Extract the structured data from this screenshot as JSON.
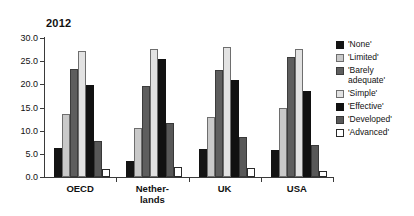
{
  "chart_data": {
    "type": "bar",
    "title": "2012",
    "xlabel": "",
    "ylabel": "",
    "ylim": [
      0,
      30
    ],
    "ytick_step": 5,
    "ytick_labels": [
      "0.0",
      "5.0",
      "10.0",
      "15.0",
      "20.0",
      "25.0",
      "30.0"
    ],
    "grid": false,
    "legend_position": "right",
    "categories": [
      "OECD",
      "Nether-\nlands",
      "UK",
      "USA"
    ],
    "category_names": [
      "OECD",
      "Netherlands",
      "UK",
      "USA"
    ],
    "series": [
      {
        "name": "'None'",
        "color": "#141414",
        "swatch_class": "sw-none",
        "bar_class": "c-none",
        "values": [
          6.2,
          3.4,
          6.0,
          5.8
        ]
      },
      {
        "name": "'Limited'",
        "color": "#c9c9c9",
        "swatch_class": "sw-limited",
        "bar_class": "c-limited",
        "values": [
          13.5,
          10.5,
          13.0,
          14.8
        ]
      },
      {
        "name": "'Barely\nadequate'",
        "color": "#5e5e5e",
        "swatch_class": "sw-barely",
        "bar_class": "c-barely",
        "values": [
          23.4,
          19.7,
          23.0,
          26.0
        ]
      },
      {
        "name": "'Simple'",
        "color": "#e2e2e2",
        "swatch_class": "sw-simple",
        "bar_class": "c-simple",
        "values": [
          27.2,
          27.7,
          28.0,
          27.6
        ]
      },
      {
        "name": "'Effective'",
        "color": "#111111",
        "swatch_class": "sw-effective",
        "bar_class": "c-effective",
        "values": [
          19.9,
          25.4,
          21.0,
          18.5
        ]
      },
      {
        "name": "'Developed'",
        "color": "#585858",
        "swatch_class": "sw-developed",
        "bar_class": "c-developed",
        "values": [
          7.8,
          11.6,
          8.6,
          7.0
        ]
      },
      {
        "name": "'Advanced'",
        "color": "#ffffff",
        "swatch_class": "sw-advanced",
        "bar_class": "c-advanced",
        "values": [
          1.7,
          2.2,
          2.0,
          1.2
        ]
      }
    ]
  }
}
